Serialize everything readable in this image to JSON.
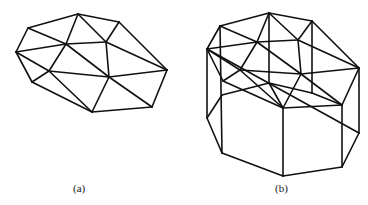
{
  "figure_a": {
    "label": "(a)",
    "label_pos": [
      73,
      182
    ],
    "description": "Triangulated irregular network (planar mesh)",
    "vertices": {
      "A": [
        78,
        14
      ],
      "B": [
        119,
        22
      ],
      "C": [
        28,
        28
      ],
      "D": [
        16,
        52
      ],
      "E": [
        66,
        44
      ],
      "F": [
        106,
        42
      ],
      "G": [
        167,
        70
      ],
      "H": [
        49,
        71
      ],
      "I": [
        109,
        77
      ],
      "J": [
        32,
        82
      ],
      "K": [
        92,
        112
      ],
      "L": [
        152,
        107
      ]
    },
    "edges": [
      [
        "C",
        "A"
      ],
      [
        "A",
        "B"
      ],
      [
        "B",
        "G"
      ],
      [
        "G",
        "L"
      ],
      [
        "L",
        "K"
      ],
      [
        "K",
        "J"
      ],
      [
        "J",
        "D"
      ],
      [
        "D",
        "C"
      ],
      [
        "C",
        "E"
      ],
      [
        "A",
        "E"
      ],
      [
        "A",
        "F"
      ],
      [
        "B",
        "F"
      ],
      [
        "D",
        "E"
      ],
      [
        "E",
        "F"
      ],
      [
        "F",
        "G"
      ],
      [
        "F",
        "I"
      ],
      [
        "E",
        "I"
      ],
      [
        "D",
        "H"
      ],
      [
        "H",
        "K"
      ],
      [
        "J",
        "H"
      ],
      [
        "H",
        "E"
      ],
      [
        "H",
        "I"
      ],
      [
        "I",
        "G"
      ],
      [
        "I",
        "L"
      ],
      [
        "I",
        "K"
      ]
    ]
  },
  "figure_b": {
    "label": "(b)",
    "label_pos": [
      275,
      182
    ],
    "description": "Triangulated surface extruded into a prism (wireframe)",
    "vertices": {
      "A": [
        269,
        13
      ],
      "B": [
        312,
        21
      ],
      "C": [
        220,
        26
      ],
      "D": [
        207,
        49
      ],
      "E": [
        257,
        42
      ],
      "F": [
        298,
        40
      ],
      "G": [
        359,
        68
      ],
      "H": [
        240,
        70
      ],
      "I": [
        301,
        74
      ],
      "J": [
        223,
        81
      ],
      "K": [
        283,
        108
      ],
      "L": [
        342,
        105
      ],
      "Dp": [
        207,
        118
      ],
      "Jp": [
        222,
        153
      ],
      "Kp": [
        283,
        176
      ],
      "Lp": [
        342,
        167
      ],
      "Gp": [
        359,
        133
      ],
      "Cm": [
        222,
        95
      ],
      "Am": [
        269,
        83
      ],
      "Bm": [
        312,
        93
      ],
      "Cb": [
        222,
        153
      ]
    },
    "edges": [
      [
        "C",
        "A"
      ],
      [
        "A",
        "B"
      ],
      [
        "B",
        "G"
      ],
      [
        "G",
        "L"
      ],
      [
        "L",
        "K"
      ],
      [
        "K",
        "J"
      ],
      [
        "J",
        "D"
      ],
      [
        "D",
        "C"
      ],
      [
        "C",
        "E"
      ],
      [
        "A",
        "E"
      ],
      [
        "A",
        "F"
      ],
      [
        "B",
        "F"
      ],
      [
        "D",
        "E"
      ],
      [
        "E",
        "F"
      ],
      [
        "F",
        "G"
      ],
      [
        "F",
        "I"
      ],
      [
        "E",
        "I"
      ],
      [
        "D",
        "H"
      ],
      [
        "H",
        "K"
      ],
      [
        "J",
        "H"
      ],
      [
        "H",
        "E"
      ],
      [
        "H",
        "I"
      ],
      [
        "I",
        "G"
      ],
      [
        "I",
        "L"
      ],
      [
        "I",
        "K"
      ],
      [
        "D",
        "Gp"
      ],
      [
        "D",
        "Dp"
      ],
      [
        "C",
        "Cb"
      ],
      [
        "A",
        "Am"
      ],
      [
        "B",
        "Bm"
      ],
      [
        "K",
        "Kp"
      ],
      [
        "L",
        "Lp"
      ],
      [
        "G",
        "Gp"
      ],
      [
        "Dp",
        "Cm"
      ],
      [
        "Cm",
        "Am"
      ],
      [
        "Am",
        "K"
      ],
      [
        "Am",
        "Bm"
      ],
      [
        "Bm",
        "L"
      ],
      [
        "Dp",
        "Jp"
      ],
      [
        "Jp",
        "Kp"
      ],
      [
        "Kp",
        "Lp"
      ],
      [
        "Lp",
        "Gp"
      ]
    ]
  },
  "colors": {
    "line": "#111111",
    "background": "#ffffff",
    "text": "#222222"
  }
}
